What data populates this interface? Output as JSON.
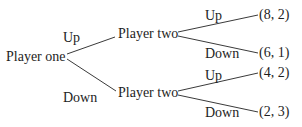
{
  "diagram": {
    "type": "game-tree",
    "root": {
      "label": "Player one",
      "moves": [
        {
          "label": "Up",
          "node": {
            "label": "Player two",
            "moves": [
              {
                "label": "Up",
                "payoff": "(8, 2)"
              },
              {
                "label": "Down",
                "payoff": "(6, 1)"
              }
            ]
          }
        },
        {
          "label": "Down",
          "node": {
            "label": "Player two",
            "moves": [
              {
                "label": "Up",
                "payoff": "(4, 2)"
              },
              {
                "label": "Down",
                "payoff": "(2, 3)"
              }
            ]
          }
        }
      ]
    },
    "colors": {
      "text": "#1e1e1e",
      "edges": "#3a3a3a",
      "background": "#ffffff"
    }
  }
}
